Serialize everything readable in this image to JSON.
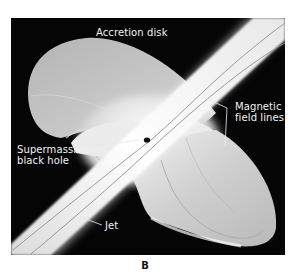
{
  "figure": {
    "panel_letter": "B",
    "background_color": "#050505",
    "labels": {
      "accretion_disk": "Accretion disk",
      "magnetic_field_lines_line1": "Magnetic",
      "magnetic_field_lines_line2": "field lines",
      "black_hole_line1": "Supermassive",
      "black_hole_line2": "black hole",
      "jet": "Jet"
    }
  }
}
